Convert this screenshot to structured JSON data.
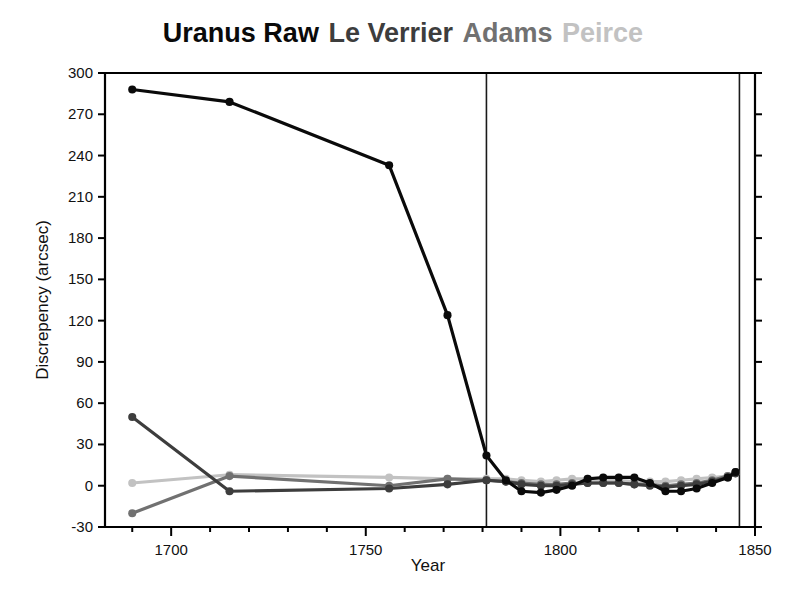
{
  "title": {
    "segments": [
      {
        "text": "Uranus Raw",
        "color": "#0a0a0a"
      },
      {
        "text": "Le Verrier",
        "color": "#3d3d3d"
      },
      {
        "text": "Adams",
        "color": "#717171"
      },
      {
        "text": "Peirce",
        "color": "#c2c2c2"
      }
    ],
    "full_text": "Uranus Raw Le Verrier Adams Peirce"
  },
  "chart_data": {
    "type": "line",
    "title": "Uranus Raw Le Verrier Adams Peirce",
    "xlabel": "Year",
    "ylabel": "Discrepency (arcsec)",
    "xlim": [
      1683,
      1850
    ],
    "ylim": [
      -30,
      300
    ],
    "xticks": [
      1700,
      1750,
      1800,
      1850
    ],
    "xtick_labels": [
      "1700",
      "1750",
      "1800",
      "1850"
    ],
    "xminor_step": 10,
    "yticks": [
      -30,
      0,
      30,
      60,
      90,
      120,
      150,
      180,
      210,
      240,
      270,
      300
    ],
    "ytick_labels": [
      "-30",
      "0",
      "30",
      "60",
      "90",
      "120",
      "150",
      "180",
      "210",
      "240",
      "270",
      "300"
    ],
    "grid": false,
    "legend": "title-colored",
    "annotations": [
      {
        "type": "vline",
        "x": 1781,
        "label": ""
      },
      {
        "type": "vline",
        "x": 1846,
        "label": ""
      }
    ],
    "series": [
      {
        "name": "Uranus Raw",
        "color": "#0a0a0a",
        "linewidth": 3.2,
        "marker": "o",
        "markersize": 6.5,
        "x": [
          1690,
          1715,
          1756,
          1771,
          1781,
          1786,
          1790,
          1795,
          1799,
          1803,
          1807,
          1811,
          1815,
          1819,
          1823,
          1827,
          1831,
          1835,
          1839,
          1843,
          1845
        ],
        "y": [
          288,
          279,
          233,
          124,
          22,
          4,
          -4,
          -5,
          -3,
          0,
          5,
          6,
          6,
          6,
          2,
          -4,
          -4,
          -2,
          2,
          6,
          10
        ]
      },
      {
        "name": "Le Verrier",
        "color": "#3d3d3d",
        "linewidth": 3.2,
        "marker": "o",
        "markersize": 6.5,
        "x": [
          1690,
          1715,
          1756,
          1771,
          1781,
          1786,
          1790,
          1795,
          1799,
          1803,
          1807,
          1811,
          1815,
          1819,
          1823,
          1827,
          1831,
          1835,
          1839,
          1843,
          1845
        ],
        "y": [
          50,
          -4,
          -2,
          1,
          4,
          3,
          1,
          0,
          0,
          1,
          2,
          2,
          2,
          1,
          0,
          -1,
          0,
          1,
          3,
          6,
          9
        ]
      },
      {
        "name": "Adams",
        "color": "#717171",
        "linewidth": 3.2,
        "marker": "o",
        "markersize": 6.5,
        "x": [
          1690,
          1715,
          1756,
          1771,
          1781,
          1786,
          1790,
          1795,
          1799,
          1803,
          1807,
          1811,
          1815,
          1819,
          1823,
          1827,
          1831,
          1835,
          1839,
          1843,
          1845
        ],
        "y": [
          -20,
          7,
          0,
          5,
          4,
          3,
          2,
          1,
          1,
          2,
          2,
          2,
          2,
          1,
          1,
          0,
          1,
          2,
          4,
          7,
          10
        ]
      },
      {
        "name": "Peirce",
        "color": "#c2c2c2",
        "linewidth": 3.2,
        "marker": "o",
        "markersize": 6.5,
        "x": [
          1690,
          1715,
          1756,
          1771,
          1781,
          1786,
          1790,
          1795,
          1799,
          1803,
          1807,
          1811,
          1815,
          1819,
          1823,
          1827,
          1831,
          1835,
          1839,
          1843,
          1845
        ],
        "y": [
          2,
          8,
          6,
          5,
          5,
          5,
          4,
          3,
          4,
          5,
          5,
          4,
          4,
          3,
          3,
          3,
          4,
          5,
          6,
          7,
          9
        ]
      }
    ]
  }
}
